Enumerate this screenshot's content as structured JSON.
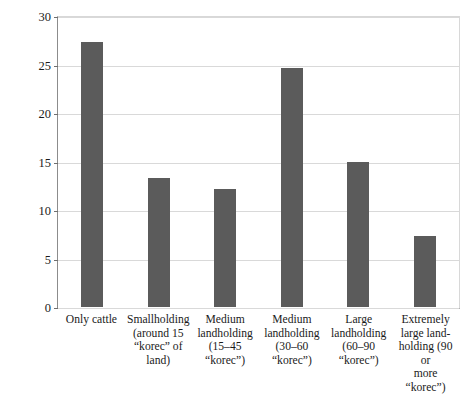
{
  "chart_data": {
    "type": "bar",
    "title": "",
    "xlabel": "",
    "ylabel": "Landholdings (%)",
    "ylim": [
      0,
      30
    ],
    "yticks": [
      0,
      5,
      10,
      15,
      20,
      25,
      30
    ],
    "ytick_labels": [
      "0",
      "5",
      "10",
      "15",
      "20",
      "25",
      "30"
    ],
    "grid": true,
    "legend": "none",
    "bar_color": "#5b5b5b",
    "categories": [
      "Only cattle",
      "Smallholding (around 15 “korec” of land)",
      "Medium landholding (15–45 “korec”)",
      "Medium landholding (30–60 “korec”)",
      "Large landholding (60–90 “korec”)",
      "Extremely large landholding (90 or more “korec”)"
    ],
    "category_lines": [
      [
        "Only cattle"
      ],
      [
        "Smallholding",
        "(around 15",
        "“korec” of land)"
      ],
      [
        "Medium",
        "landholding",
        "(15–45",
        "“korec”)"
      ],
      [
        "Medium",
        "landholding",
        "(30–60",
        "“korec”)"
      ],
      [
        "Large",
        "landholding",
        "(60–90",
        "“korec”)"
      ],
      [
        "Extremely",
        "large land-",
        "holding (90 or",
        "more “korec”)"
      ]
    ],
    "values": [
      27.3,
      13.3,
      12.2,
      24.6,
      14.9,
      7.3
    ]
  }
}
